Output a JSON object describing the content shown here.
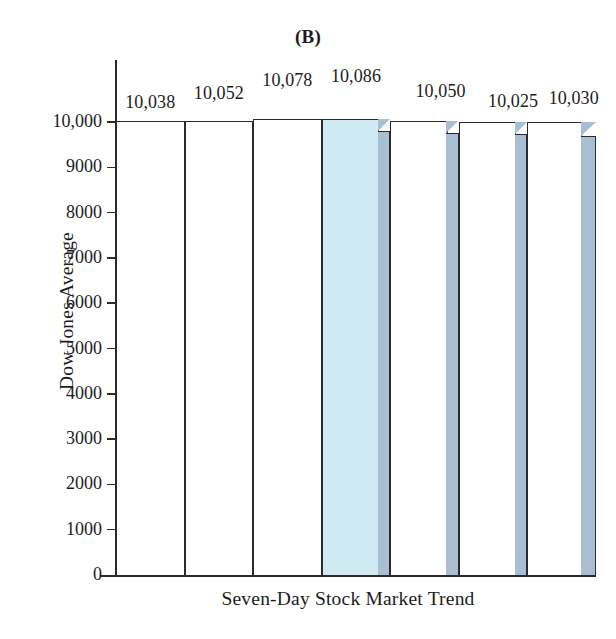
{
  "chart_data": {
    "type": "bar",
    "title": "(B)",
    "xlabel": "Seven-Day Stock Market Trend",
    "ylabel": "Dow Jones Average",
    "categories": [
      "Day 1",
      "Day 2",
      "Day 3",
      "Day 4",
      "Day 5",
      "Day 6",
      "Day 7"
    ],
    "values": [
      10038,
      10052,
      10078,
      10086,
      10050,
      10025,
      10030
    ],
    "data_labels": [
      "10,038",
      "10,052",
      "10,078",
      "10,086",
      "10,050",
      "10,025",
      "10,030"
    ],
    "ylim": [
      0,
      10000
    ],
    "ytick_values": [
      0,
      1000,
      2000,
      3000,
      4000,
      5000,
      6000,
      7000,
      8000,
      9000,
      10000
    ],
    "ytick_labels": [
      "0",
      "1000",
      "2000",
      "3000",
      "4000",
      "5000",
      "6000",
      "7000",
      "8000",
      "9000",
      "10,000"
    ],
    "grid": false,
    "legend": false,
    "note": "Truncated-looking bars: all values exceed the 10,000 axis maximum so bar tops extend just above the top tick, visually exaggerating small differences.",
    "colors": {
      "bar_fill": "#ffffff",
      "bar_outline": "#2b2b2b",
      "highlight_fill": "#cfeaf3",
      "side_face": "#a9bed2",
      "text": "#1c1c1c"
    },
    "highlight_index": 3,
    "bars_with_3d_side": [
      3,
      4,
      5,
      6
    ]
  }
}
